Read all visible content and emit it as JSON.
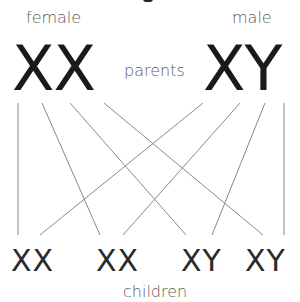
{
  "diagram": {
    "parents": {
      "label": "parents",
      "female": {
        "label": "female",
        "chromosomes": "XX"
      },
      "male": {
        "label": "male",
        "chromosomes": "XY"
      }
    },
    "children": {
      "label": "children",
      "items": [
        {
          "chromosomes": "XX"
        },
        {
          "chromosomes": "XX"
        },
        {
          "chromosomes": "XY"
        },
        {
          "chromosomes": "XY"
        }
      ]
    },
    "line_color": "#8a8a8a"
  }
}
